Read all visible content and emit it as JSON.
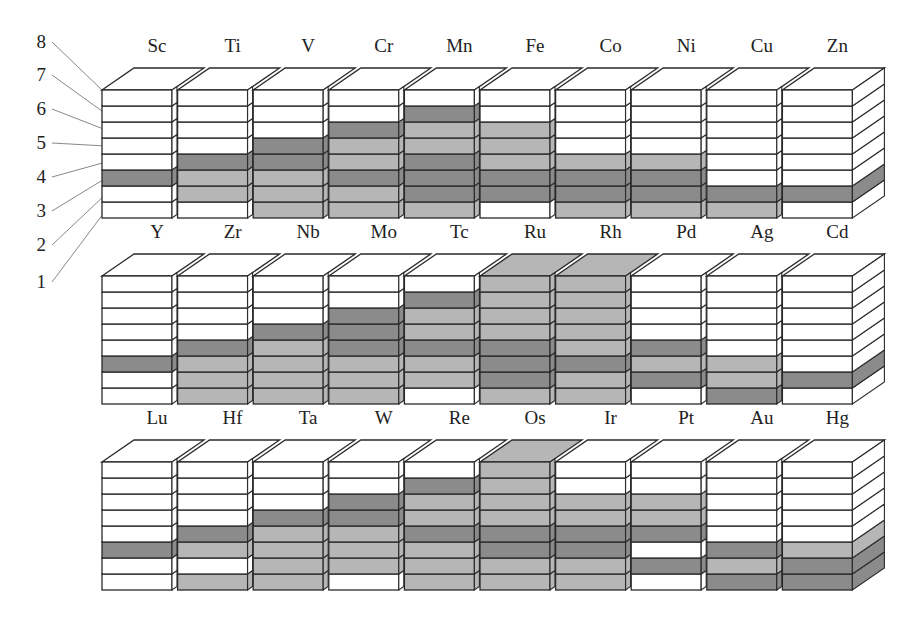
{
  "diagram": {
    "type": "oxidation-state-blocks",
    "level_labels": [
      "1",
      "2",
      "3",
      "4",
      "5",
      "6",
      "7",
      "8"
    ],
    "fill_legend": {
      "0": "none (white)",
      "1": "known state (light gray)",
      "2": "common state (dark gray)"
    },
    "colors": {
      "white": "#ffffff",
      "light": "#b6b6b6",
      "dark": "#8b8b8b",
      "stroke": "#2a2a2a",
      "leader": "#888888"
    },
    "rows": [
      {
        "elements": [
          {
            "symbol": "Sc",
            "levels": [
              0,
              0,
              2,
              0,
              0,
              0,
              0,
              0
            ]
          },
          {
            "symbol": "Ti",
            "levels": [
              0,
              1,
              1,
              2,
              0,
              0,
              0,
              0
            ]
          },
          {
            "symbol": "V",
            "levels": [
              1,
              1,
              1,
              2,
              2,
              0,
              0,
              0
            ]
          },
          {
            "symbol": "Cr",
            "levels": [
              1,
              1,
              2,
              1,
              1,
              2,
              0,
              0
            ]
          },
          {
            "symbol": "Mn",
            "levels": [
              1,
              2,
              2,
              2,
              1,
              1,
              2,
              0
            ]
          },
          {
            "symbol": "Fe",
            "levels": [
              0,
              2,
              2,
              1,
              1,
              1,
              0,
              0
            ]
          },
          {
            "symbol": "Co",
            "levels": [
              1,
              2,
              2,
              1,
              0,
              0,
              0,
              0
            ]
          },
          {
            "symbol": "Ni",
            "levels": [
              1,
              2,
              2,
              1,
              0,
              0,
              0,
              0
            ]
          },
          {
            "symbol": "Cu",
            "levels": [
              1,
              2,
              0,
              0,
              0,
              0,
              0,
              0
            ]
          },
          {
            "symbol": "Zn",
            "levels": [
              0,
              2,
              0,
              0,
              0,
              0,
              0,
              0
            ]
          }
        ]
      },
      {
        "elements": [
          {
            "symbol": "Y",
            "levels": [
              0,
              0,
              2,
              0,
              0,
              0,
              0,
              0
            ]
          },
          {
            "symbol": "Zr",
            "levels": [
              1,
              1,
              1,
              2,
              0,
              0,
              0,
              0
            ]
          },
          {
            "symbol": "Nb",
            "levels": [
              1,
              1,
              1,
              1,
              2,
              0,
              0,
              0
            ]
          },
          {
            "symbol": "Mo",
            "levels": [
              1,
              1,
              1,
              2,
              2,
              2,
              0,
              0
            ]
          },
          {
            "symbol": "Tc",
            "levels": [
              0,
              1,
              1,
              2,
              1,
              1,
              2,
              0
            ]
          },
          {
            "symbol": "Ru",
            "levels": [
              1,
              2,
              2,
              2,
              1,
              1,
              1,
              1
            ]
          },
          {
            "symbol": "Rh",
            "levels": [
              1,
              1,
              2,
              1,
              1,
              1,
              1,
              1
            ]
          },
          {
            "symbol": "Pd",
            "levels": [
              0,
              2,
              1,
              2,
              0,
              0,
              0,
              0
            ]
          },
          {
            "symbol": "Ag",
            "levels": [
              2,
              1,
              1,
              0,
              0,
              0,
              0,
              0
            ]
          },
          {
            "symbol": "Cd",
            "levels": [
              0,
              2,
              0,
              0,
              0,
              0,
              0,
              0
            ]
          }
        ]
      },
      {
        "elements": [
          {
            "symbol": "Lu",
            "levels": [
              0,
              0,
              2,
              0,
              0,
              0,
              0,
              0
            ]
          },
          {
            "symbol": "Hf",
            "levels": [
              1,
              0,
              1,
              2,
              0,
              0,
              0,
              0
            ]
          },
          {
            "symbol": "Ta",
            "levels": [
              1,
              1,
              1,
              1,
              2,
              0,
              0,
              0
            ]
          },
          {
            "symbol": "W",
            "levels": [
              0,
              1,
              1,
              1,
              2,
              2,
              0,
              0
            ]
          },
          {
            "symbol": "Re",
            "levels": [
              1,
              1,
              1,
              2,
              1,
              1,
              2,
              0
            ]
          },
          {
            "symbol": "Os",
            "levels": [
              1,
              1,
              2,
              2,
              1,
              1,
              1,
              1
            ]
          },
          {
            "symbol": "Ir",
            "levels": [
              1,
              1,
              2,
              2,
              1,
              1,
              0,
              0
            ]
          },
          {
            "symbol": "Pt",
            "levels": [
              0,
              2,
              0,
              2,
              1,
              1,
              0,
              0
            ]
          },
          {
            "symbol": "Au",
            "levels": [
              2,
              1,
              2,
              0,
              0,
              0,
              0,
              0
            ]
          },
          {
            "symbol": "Hg",
            "levels": [
              2,
              2,
              1,
              0,
              0,
              0,
              0,
              0
            ]
          }
        ]
      }
    ]
  }
}
